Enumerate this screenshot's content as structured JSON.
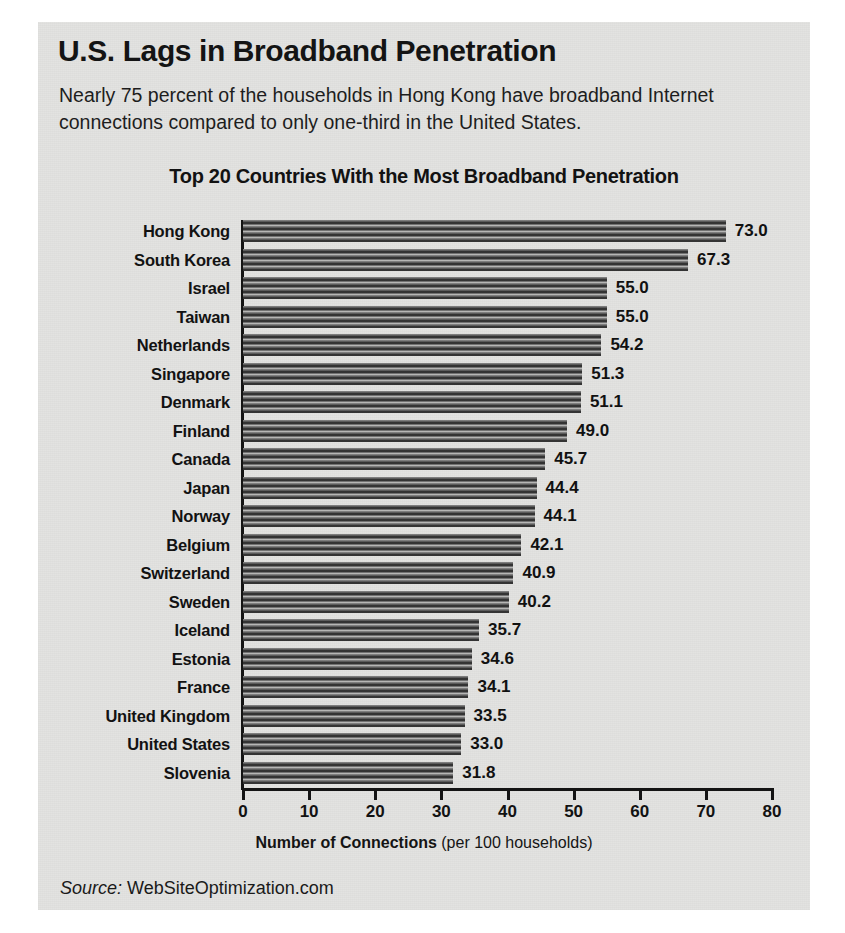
{
  "headline": "U.S. Lags in Broadband Penetration",
  "deck": "Nearly 75 percent of the households in Hong Kong have broadband Internet connections compared to only one-third in the United States.",
  "source": {
    "label": "Source:",
    "name": "WebSiteOptimization.com"
  },
  "axis_title": {
    "strong": "Number of Connections",
    "paren": "(per 100 households)"
  },
  "colors": {
    "panel_background": "#e3e3e1",
    "page_background": "#ffffff",
    "bar_dark": "#1d1d1d",
    "bar_light": "#d2d2d0",
    "text": "#121212",
    "axis": "#141414"
  },
  "chart_data": {
    "type": "bar",
    "orientation": "horizontal",
    "title": "Top 20 Countries With the Most Broadband Penetration",
    "xlabel": "Number of Connections (per 100 households)",
    "ylabel": "",
    "xlim": [
      0,
      80
    ],
    "xticks": [
      0,
      10,
      20,
      30,
      40,
      50,
      60,
      70,
      80
    ],
    "grid": false,
    "legend": false,
    "categories": [
      "Hong Kong",
      "South Korea",
      "Israel",
      "Taiwan",
      "Netherlands",
      "Singapore",
      "Denmark",
      "Finland",
      "Canada",
      "Japan",
      "Norway",
      "Belgium",
      "Switzerland",
      "Sweden",
      "Iceland",
      "Estonia",
      "France",
      "United Kingdom",
      "United States",
      "Slovenia"
    ],
    "values": [
      73.0,
      67.3,
      55.0,
      55.0,
      54.2,
      51.3,
      51.1,
      49.0,
      45.7,
      44.4,
      44.1,
      42.1,
      40.9,
      40.2,
      35.7,
      34.6,
      34.1,
      33.5,
      33.0,
      31.8
    ],
    "value_labels": [
      "73.0",
      "67.3",
      "55.0",
      "55.0",
      "54.2",
      "51.3",
      "51.1",
      "49.0",
      "45.7",
      "44.4",
      "44.1",
      "42.1",
      "40.9",
      "40.2",
      "35.7",
      "34.6",
      "34.1",
      "33.5",
      "33.0",
      "31.8"
    ]
  }
}
